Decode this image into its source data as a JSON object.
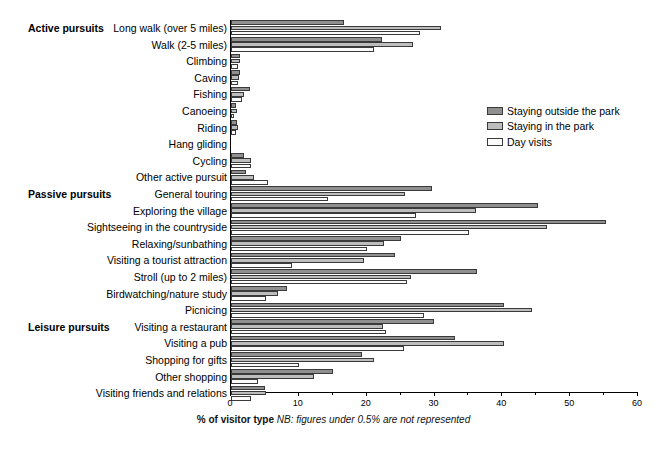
{
  "chart_data": {
    "type": "bar",
    "orientation": "horizontal",
    "title": "",
    "xlabel": "% of visitor type",
    "xlabel_note": "NB: figures under 0.5% are not represented",
    "ylabel": "",
    "xlim": [
      0,
      60
    ],
    "xticks": [
      0,
      10,
      20,
      30,
      40,
      50,
      60
    ],
    "xtick_labels": [
      "0",
      "10",
      "20",
      "30",
      "40",
      "50",
      "60"
    ],
    "grid": false,
    "legend_position": "upper right",
    "series": [
      {
        "name": "Staying outside the park",
        "color": "#8f8f8f",
        "values": [
          16.7,
          22.3,
          1.3,
          1.3,
          2.8,
          0.7,
          0.9,
          0,
          1.9,
          2.2,
          29.6,
          45.3,
          55.3,
          25.0,
          24.2,
          36.2,
          8.2,
          40.3,
          29.9,
          33.0,
          19.3,
          15.0,
          5.0
        ]
      },
      {
        "name": "Staying in the park",
        "color": "#bdbdbd",
        "values": [
          31.0,
          26.8,
          1.3,
          1.2,
          1.9,
          0.9,
          1.1,
          0,
          3.0,
          3.4,
          25.7,
          36.1,
          46.6,
          22.6,
          19.6,
          26.6,
          6.9,
          44.4,
          22.4,
          40.3,
          21.1,
          12.2,
          5.2
        ]
      },
      {
        "name": "Day visits",
        "color": "#fbfbfb",
        "values": [
          27.9,
          21.1,
          1.0,
          1.0,
          1.6,
          0.5,
          0.8,
          0,
          2.9,
          5.4,
          14.3,
          27.3,
          35.1,
          20.0,
          9.0,
          26.0,
          5.1,
          28.5,
          22.9,
          25.5,
          10.0,
          4.0,
          3.0
        ]
      }
    ],
    "categories": [
      "Long walk (over 5 miles)",
      "Walk (2-5 miles)",
      "Climbing",
      "Caving",
      "Fishing",
      "Canoeing",
      "Riding",
      "Hang gliding",
      "Cycling",
      "Other active pursuit",
      "General touring",
      "Exploring the village",
      "Sightseeing in the countryside",
      "Relaxing/sunbathing",
      "Visiting a tourist attraction",
      "Stroll (up to 2 miles)",
      "Birdwatching/nature study",
      "Picnicing",
      "Visiting a restaurant",
      "Visiting a pub",
      "Shopping for gifts",
      "Other shopping",
      "Visiting friends and relations"
    ],
    "group_labels": [
      {
        "label": "Active pursuits",
        "category_index": 0
      },
      {
        "label": "Passive pursuits",
        "category_index": 10
      },
      {
        "label": "Leisure pursuits",
        "category_index": 18
      }
    ]
  }
}
